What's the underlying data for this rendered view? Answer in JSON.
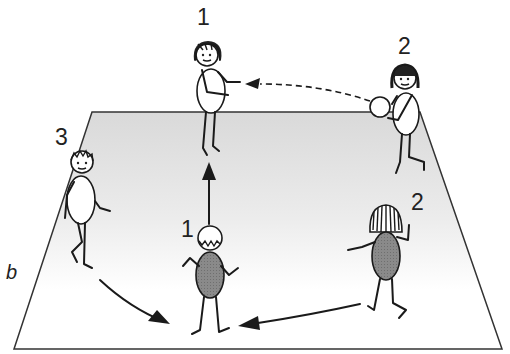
{
  "diagram": {
    "panel_label": "b",
    "field": {
      "fill_top": "#dcdcdc",
      "fill_bottom": "#ffffff",
      "stroke": "#333333"
    },
    "players": [
      {
        "id": "p1-top",
        "label": "1",
        "role": "receiver",
        "body_fill": "#ffffff"
      },
      {
        "id": "p2-top",
        "label": "2",
        "role": "thrower-with-ball",
        "body_fill": "#ffffff"
      },
      {
        "id": "p3",
        "label": "3",
        "role": "runner",
        "body_fill": "#ffffff"
      },
      {
        "id": "p1-bottom",
        "label": "1",
        "role": "catcher-center",
        "body_fill": "#808080"
      },
      {
        "id": "p2-bottom",
        "label": "2",
        "role": "runner",
        "body_fill": "#808080"
      }
    ],
    "arrows": [
      {
        "from": "p2-top",
        "to": "p1-top",
        "style": "dashed",
        "meaning": "pass"
      },
      {
        "from": "p1-bottom",
        "to": "p1-top",
        "style": "solid",
        "meaning": "move up"
      },
      {
        "from": "p3",
        "to": "center-bottom",
        "style": "solid-curved",
        "meaning": "run"
      },
      {
        "from": "p2-bottom",
        "to": "center-bottom",
        "style": "solid",
        "meaning": "run"
      }
    ]
  }
}
